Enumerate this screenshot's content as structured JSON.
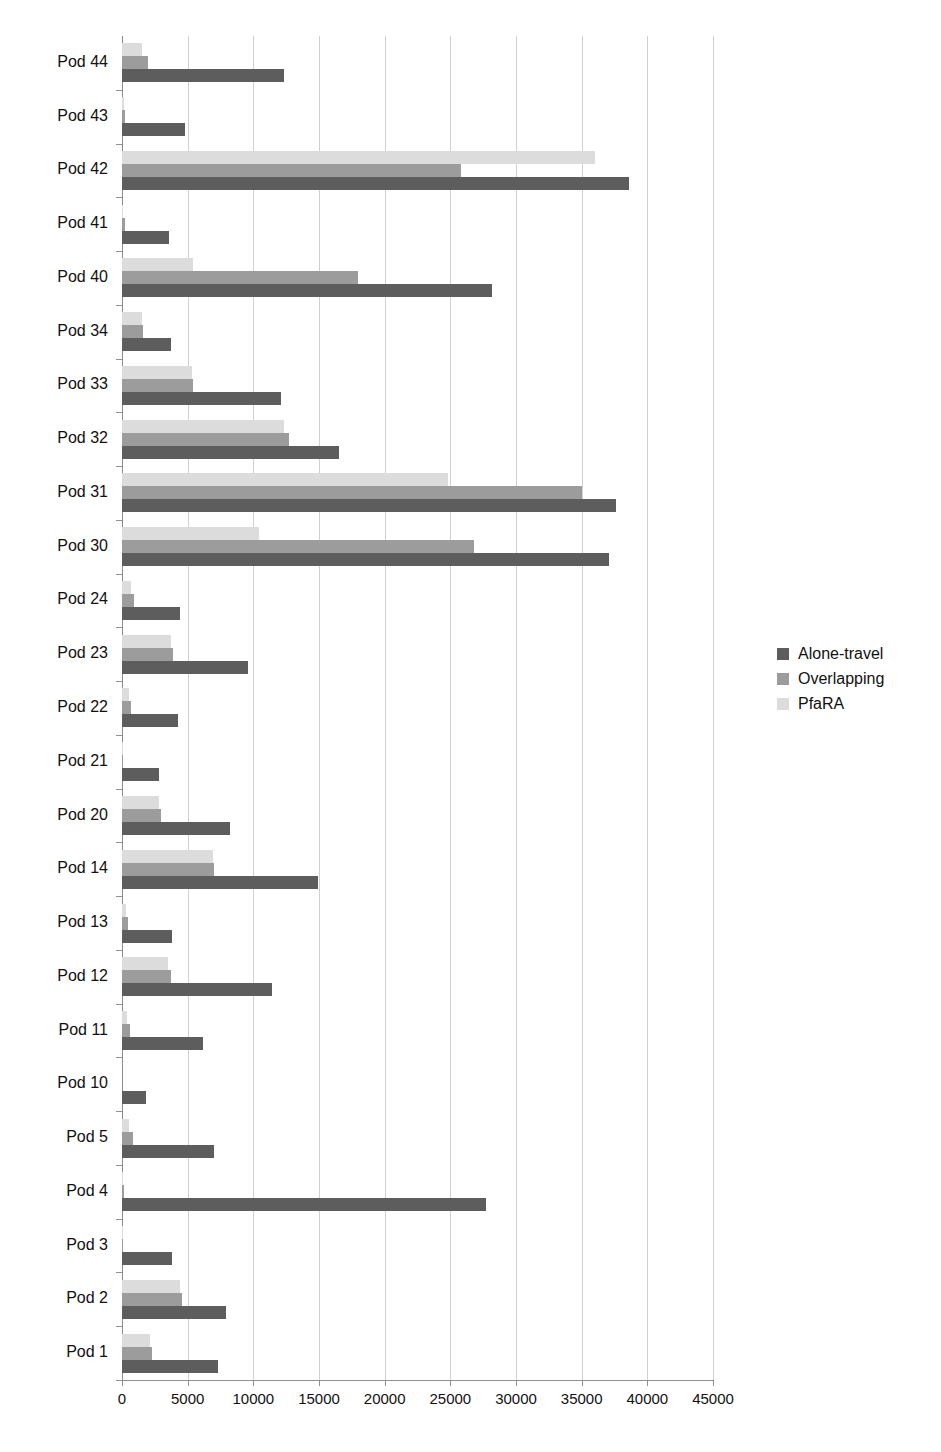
{
  "chart_data": {
    "type": "bar",
    "orientation": "horizontal",
    "title": "",
    "xlabel": "",
    "ylabel": "",
    "xlim": [
      0,
      45000
    ],
    "xticks": [
      0,
      5000,
      10000,
      15000,
      20000,
      25000,
      30000,
      35000,
      40000,
      45000
    ],
    "xticklabels": [
      "0",
      "5000",
      "10000",
      "15000",
      "20000",
      "25000",
      "30000",
      "35000",
      "40000",
      "45000"
    ],
    "grid": true,
    "grid_axis": "x",
    "legend_position": "right",
    "categories": [
      "Pod 44",
      "Pod 43",
      "Pod 42",
      "Pod 41",
      "Pod 40",
      "Pod 34",
      "Pod 33",
      "Pod 32",
      "Pod 31",
      "Pod 30",
      "Pod 24",
      "Pod 23",
      "Pod 22",
      "Pod 21",
      "Pod 20",
      "Pod 14",
      "Pod 13",
      "Pod 12",
      "Pod 11",
      "Pod 10",
      "Pod 5",
      "Pod 4",
      "Pod 3",
      "Pod 2",
      "Pod 1"
    ],
    "series": [
      {
        "name": "Alone-travel",
        "color": "#5d5d5d",
        "values": [
          12300,
          4800,
          38600,
          3600,
          28200,
          3700,
          12100,
          16500,
          37600,
          37100,
          4400,
          9600,
          4300,
          2800,
          8200,
          14900,
          3800,
          11400,
          6200,
          1800,
          7000,
          27700,
          3800,
          7900,
          7300
        ]
      },
      {
        "name": "Overlapping",
        "color": "#9c9c9c",
        "values": [
          2000,
          250,
          25800,
          200,
          18000,
          1600,
          5400,
          12700,
          35000,
          26800,
          900,
          3900,
          700,
          100,
          3000,
          7000,
          450,
          3700,
          600,
          0,
          800,
          150,
          100,
          4600,
          2300
        ]
      },
      {
        "name": "PfaRA",
        "color": "#dcdcdc",
        "values": [
          1500,
          150,
          36000,
          100,
          5400,
          1500,
          5300,
          12300,
          24800,
          10400,
          700,
          3700,
          500,
          80,
          2800,
          6900,
          300,
          3500,
          400,
          0,
          500,
          100,
          80,
          4400,
          2100
        ]
      }
    ]
  },
  "legend": {
    "items": [
      {
        "label": "Alone-travel",
        "series_class": "s-alone"
      },
      {
        "label": "Overlapping",
        "series_class": "s-overlapping"
      },
      {
        "label": "PfaRA",
        "series_class": "s-pfara"
      }
    ]
  }
}
